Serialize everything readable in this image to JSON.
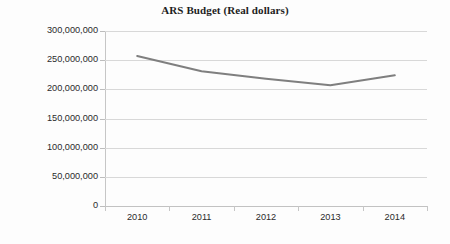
{
  "chart_data": {
    "type": "line",
    "title": "ARS Budget (Real dollars)",
    "xlabel": "",
    "ylabel": "",
    "categories": [
      "2010",
      "2011",
      "2012",
      "2013",
      "2014"
    ],
    "series": [
      {
        "name": "ARS Budget (Real dollars)",
        "values": [
          257000000,
          231000000,
          218000000,
          207000000,
          224000000
        ],
        "color": "#7f7f7f"
      }
    ],
    "ylim": [
      0,
      300000000
    ],
    "ytick_values": [
      0,
      50000000,
      100000000,
      150000000,
      200000000,
      250000000,
      300000000
    ],
    "ytick_labels": [
      "300,000,000",
      "250,000,000",
      "200,000,000",
      "150,000,000",
      "100,000,000",
      "50,000,000",
      "0"
    ],
    "grid": true,
    "legend": "none",
    "annotations": []
  },
  "axis": {
    "y_labels": [
      "300,000,000",
      "250,000,000",
      "200,000,000",
      "150,000,000",
      "100,000,000",
      "50,000,000",
      "0"
    ],
    "x_labels": [
      "2010",
      "2011",
      "2012",
      "2013",
      "2014"
    ]
  },
  "colors": {
    "series_line": "#7f7f7f",
    "gridline": "#d8d8d8",
    "axis": "#c6c6c6",
    "text": "#2b2b2b",
    "title": "#1d1d1d",
    "background": "#fdfdfd"
  }
}
